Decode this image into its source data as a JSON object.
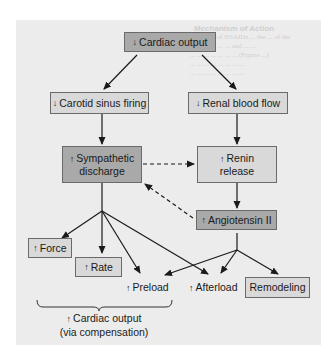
{
  "background_text": {
    "heading": "Mechanism of Action",
    "lines": [
      "...ulation of NSAIDs ... the ... of the",
      "... ... ... ... ... ... and ... ...",
      "... ... ... ... ... ... ... (Figure ...)",
      "... ... ... ... ... ... ... ...",
      "... ... ... ... ... ... ... ..."
    ]
  },
  "symbols": {
    "up": "↑",
    "down": "↓"
  },
  "nodes": {
    "cardiac_output": {
      "arrow": "↓",
      "label": "Cardiac output",
      "fill": "#a9a9a9"
    },
    "carotid_sinus": {
      "arrow": "↓",
      "label": "Carotid sinus firing",
      "fill": "#d9d9d9"
    },
    "renal_blood_flow": {
      "arrow": "↓",
      "label": "Renal blood flow",
      "fill": "#d9d9d9"
    },
    "sympathetic": {
      "arrow": "↑",
      "label_line1": "Sympathetic",
      "label_line2": "discharge",
      "fill": "#a9a9a9"
    },
    "renin": {
      "arrow": "↑",
      "label_line1": "Renin",
      "label_line2": "release",
      "fill": "#d9d9d9"
    },
    "angiotensin": {
      "arrow": "↑",
      "label": "Angiotensin II",
      "fill": "#a9a9a9"
    },
    "force": {
      "arrow": "↑",
      "label": "Force"
    },
    "rate": {
      "arrow": "↑",
      "label": "Rate"
    },
    "preload": {
      "arrow": "↑",
      "label": "Preload"
    },
    "afterload": {
      "arrow": "↑",
      "label": "Afterload"
    },
    "remodeling": {
      "label": "Remodeling"
    }
  },
  "caption": {
    "arrow": "↑",
    "line1": "Cardiac output",
    "line2": "(via compensation)"
  },
  "edges": [
    {
      "from": "Cardiac output",
      "to": "Carotid sinus firing",
      "style": "solid"
    },
    {
      "from": "Cardiac output",
      "to": "Renal blood flow",
      "style": "solid"
    },
    {
      "from": "Carotid sinus firing",
      "to": "Sympathetic discharge",
      "style": "solid"
    },
    {
      "from": "Renal blood flow",
      "to": "Renin release",
      "style": "solid"
    },
    {
      "from": "Sympathetic discharge",
      "to": "Renin release",
      "style": "dashed"
    },
    {
      "from": "Renin release",
      "to": "Angiotensin II",
      "style": "solid"
    },
    {
      "from": "Angiotensin II",
      "to": "Sympathetic discharge",
      "style": "dashed"
    },
    {
      "from": "Sympathetic discharge",
      "to": "Force",
      "style": "solid"
    },
    {
      "from": "Sympathetic discharge",
      "to": "Rate",
      "style": "solid"
    },
    {
      "from": "Sympathetic discharge",
      "to": "Preload",
      "style": "solid"
    },
    {
      "from": "Sympathetic discharge",
      "to": "Afterload",
      "style": "solid"
    },
    {
      "from": "Angiotensin II",
      "to": "Preload",
      "style": "solid"
    },
    {
      "from": "Angiotensin II",
      "to": "Afterload",
      "style": "solid"
    },
    {
      "from": "Angiotensin II",
      "to": "Remodeling",
      "style": "solid"
    }
  ],
  "colors": {
    "panel": "#ececec",
    "dark_box": "#a9a9a9",
    "light_box": "#d9d9d9",
    "border": "#6a6a6a",
    "line": "#1a1a1a"
  }
}
